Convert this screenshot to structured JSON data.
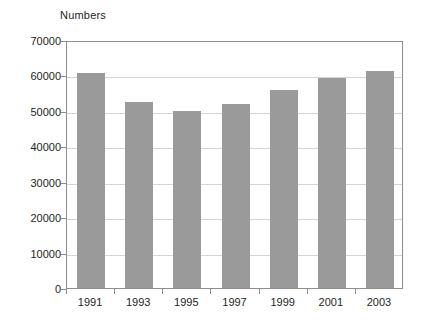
{
  "chart_data": {
    "type": "bar",
    "title": "",
    "subtitle": "",
    "ylabel": "Numbers",
    "xlabel": "",
    "categories": [
      "1991",
      "1993",
      "1995",
      "1997",
      "1999",
      "2001",
      "2003"
    ],
    "values": [
      60800,
      52400,
      49900,
      51800,
      56000,
      59400,
      61300
    ],
    "series": [
      {
        "name": "Numbers",
        "values": [
          60800,
          52400,
          49900,
          51800,
          56000,
          59400,
          61300
        ]
      }
    ],
    "ylim": [
      0,
      70000
    ],
    "ytick_labels": [
      "70000",
      "60000",
      "50000",
      "40000",
      "30000",
      "20000",
      "10000",
      "0"
    ],
    "ytick_values": [
      70000,
      60000,
      50000,
      40000,
      30000,
      20000,
      10000,
      0
    ],
    "grid": true,
    "grid_axis": "y",
    "legend": false,
    "legend_position": "none",
    "bar_color": "#9a9a9a",
    "grid_color": "#d4d4d4",
    "axis_color": "#8d8d8d",
    "background_color": "#ffffff",
    "text_color": "#231f20",
    "annotations": []
  }
}
